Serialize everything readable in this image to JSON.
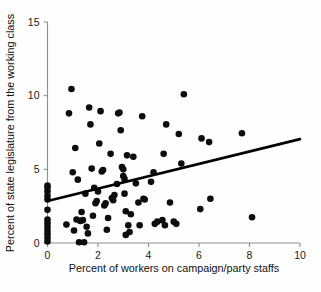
{
  "chart_data": {
    "type": "scatter",
    "title": "",
    "xlabel": "Percent of workers on campaign/party staffs",
    "ylabel": "Percent of state legislature from the working class",
    "xlim": [
      0,
      10
    ],
    "ylim": [
      0,
      15
    ],
    "xticks": [
      0,
      2,
      4,
      6,
      8,
      10
    ],
    "yticks": [
      0,
      5,
      10,
      15
    ],
    "xtick_labels": [
      "0",
      "2",
      "4",
      "6",
      "8",
      "10"
    ],
    "ytick_labels": [
      "0",
      "5",
      "10",
      "15"
    ],
    "grid": false,
    "legend": null,
    "marker": "filled-circle",
    "marker_color": "#0d0d0d",
    "axis_color": "#8f8f8f",
    "fit_line": {
      "type": "linear-regression",
      "color": "#000000",
      "x_start": 0.0,
      "y_start": 2.85,
      "x_end": 10.0,
      "y_end": 7.05
    },
    "points": [
      [
        0.0,
        0.1
      ],
      [
        0.0,
        0.35
      ],
      [
        0.0,
        0.6
      ],
      [
        0.0,
        0.85
      ],
      [
        0.0,
        1.1
      ],
      [
        0.0,
        1.35
      ],
      [
        0.0,
        1.6
      ],
      [
        0.0,
        2.25
      ],
      [
        0.0,
        2.95
      ],
      [
        0.0,
        3.2
      ],
      [
        0.0,
        3.5
      ],
      [
        0.0,
        3.75
      ],
      [
        0.0,
        3.9
      ],
      [
        0.75,
        1.25
      ],
      [
        0.85,
        8.8
      ],
      [
        0.95,
        10.45
      ],
      [
        1.0,
        4.8
      ],
      [
        1.05,
        0.85
      ],
      [
        1.1,
        6.45
      ],
      [
        1.15,
        1.6
      ],
      [
        1.2,
        4.3
      ],
      [
        1.25,
        0.05
      ],
      [
        1.3,
        1.5
      ],
      [
        1.35,
        2.1
      ],
      [
        1.4,
        1.55
      ],
      [
        1.45,
        0.05
      ],
      [
        1.5,
        3.35
      ],
      [
        1.55,
        1.1
      ],
      [
        1.6,
        0.65
      ],
      [
        1.65,
        9.2
      ],
      [
        1.7,
        8.05
      ],
      [
        1.75,
        5.05
      ],
      [
        1.8,
        1.85
      ],
      [
        1.85,
        3.75
      ],
      [
        1.9,
        2.7
      ],
      [
        1.95,
        2.85
      ],
      [
        2.0,
        3.5
      ],
      [
        2.05,
        6.75
      ],
      [
        2.1,
        8.95
      ],
      [
        2.15,
        4.85
      ],
      [
        2.2,
        4.95
      ],
      [
        2.25,
        2.55
      ],
      [
        2.3,
        2.7
      ],
      [
        2.35,
        0.9
      ],
      [
        2.4,
        1.7
      ],
      [
        2.5,
        6.05
      ],
      [
        2.55,
        3.05
      ],
      [
        2.6,
        2.9
      ],
      [
        2.65,
        3.25
      ],
      [
        2.75,
        4.0
      ],
      [
        2.8,
        8.8
      ],
      [
        2.85,
        8.85
      ],
      [
        2.9,
        7.65
      ],
      [
        2.95,
        5.15
      ],
      [
        3.0,
        5.0
      ],
      [
        3.0,
        4.55
      ],
      [
        3.05,
        4.35
      ],
      [
        3.05,
        3.35
      ],
      [
        3.1,
        2.15
      ],
      [
        3.1,
        0.55
      ],
      [
        3.15,
        5.95
      ],
      [
        3.2,
        1.2
      ],
      [
        3.25,
        0.75
      ],
      [
        3.3,
        1.95
      ],
      [
        3.4,
        5.85
      ],
      [
        3.5,
        4.05
      ],
      [
        3.6,
        2.75
      ],
      [
        3.65,
        1.2
      ],
      [
        3.75,
        8.6
      ],
      [
        3.8,
        3.0
      ],
      [
        3.85,
        2.95
      ],
      [
        4.1,
        4.15
      ],
      [
        4.2,
        4.8
      ],
      [
        4.25,
        1.3
      ],
      [
        4.35,
        1.45
      ],
      [
        4.55,
        1.55
      ],
      [
        4.6,
        6.05
      ],
      [
        4.65,
        1.2
      ],
      [
        4.7,
        8.05
      ],
      [
        4.85,
        2.75
      ],
      [
        5.0,
        1.45
      ],
      [
        5.1,
        1.3
      ],
      [
        5.2,
        7.4
      ],
      [
        5.3,
        5.4
      ],
      [
        5.4,
        10.1
      ],
      [
        6.05,
        2.3
      ],
      [
        6.1,
        7.1
      ],
      [
        6.4,
        6.85
      ],
      [
        6.45,
        3.0
      ],
      [
        7.7,
        7.45
      ],
      [
        8.1,
        1.75
      ]
    ]
  }
}
